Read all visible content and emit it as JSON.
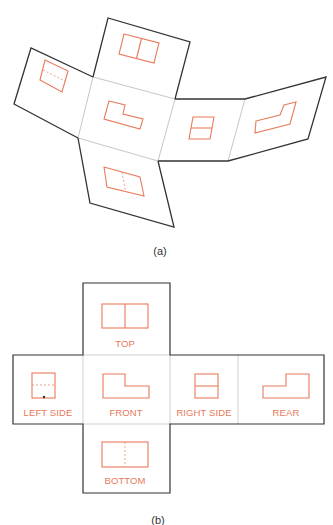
{
  "figure": {
    "part_a": {
      "caption": "(a)",
      "description": "Unfolded glass box with six projected views, shown in perspective"
    },
    "part_b": {
      "caption": "(b)",
      "views": [
        {
          "id": "top",
          "label": "TOP"
        },
        {
          "id": "left",
          "label": "LEFT SIDE"
        },
        {
          "id": "front",
          "label": "FRONT"
        },
        {
          "id": "right",
          "label": "RIGHT SIDE"
        },
        {
          "id": "rear",
          "label": "REAR"
        },
        {
          "id": "bottom",
          "label": "BOTTOM"
        }
      ]
    }
  },
  "colors": {
    "outline": "#333333",
    "fold_line": "#b8b8b8",
    "view_lines": "#ea7a5c"
  }
}
